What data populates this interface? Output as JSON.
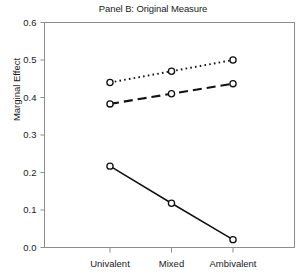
{
  "chart_data": {
    "type": "line",
    "title": "Panel B: Original Measure",
    "xlabel": "",
    "ylabel": "Marginal Effect",
    "categories": [
      "Univalent",
      "Mixed",
      "Ambivalent"
    ],
    "ylim": [
      0.0,
      0.6
    ],
    "yticks": [
      "0.0",
      "0.1",
      "0.2",
      "0.3",
      "0.4",
      "0.5",
      "0.6"
    ],
    "ytick_values": [
      0.0,
      0.1,
      0.2,
      0.3,
      0.4,
      0.5,
      0.6
    ],
    "grid": false,
    "legend": "none",
    "marker": "open-circle",
    "series": [
      {
        "name": "dotted-series",
        "style": "dotted",
        "values": [
          0.44,
          0.47,
          0.5
        ]
      },
      {
        "name": "dashed-series",
        "style": "dashed",
        "values": [
          0.383,
          0.41,
          0.437
        ]
      },
      {
        "name": "solid-series",
        "style": "solid",
        "values": [
          0.217,
          0.118,
          0.021
        ]
      }
    ]
  },
  "colors": {
    "line": "#111111",
    "axis": "#8d8d8d",
    "text": "#1a1a1a",
    "background": "#ffffff"
  }
}
